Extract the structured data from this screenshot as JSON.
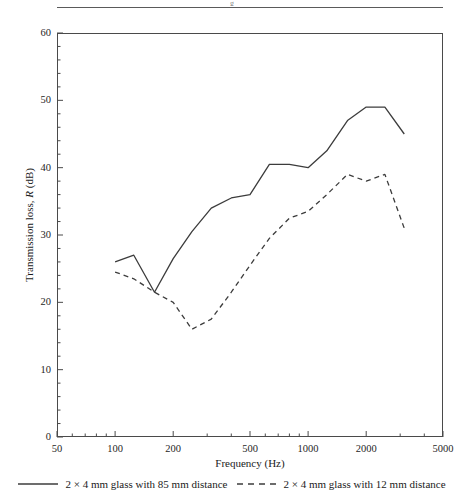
{
  "page": {
    "running_head_clipped": "g"
  },
  "chart_data": {
    "type": "line",
    "title": "",
    "xlabel": "Frequency (Hz)",
    "ylabel": "Transmission loss, R (dB)",
    "ylabel_parts": {
      "pre": "Transmission loss, ",
      "italic": "R",
      "post": " (dB)"
    },
    "xscale": "log",
    "yscale": "linear",
    "xlim": [
      50,
      5000
    ],
    "ylim": [
      0,
      60
    ],
    "grid": false,
    "legend_position": "bottom-outside",
    "xticks": [
      50,
      100,
      200,
      500,
      1000,
      2000,
      5000
    ],
    "xtick_labels": [
      "50",
      "100",
      "200",
      "500",
      "1000",
      "2000",
      "5000"
    ],
    "yticks": [
      0,
      10,
      20,
      30,
      40,
      50,
      60
    ],
    "ytick_labels": [
      "0",
      "10",
      "20",
      "30",
      "40",
      "50",
      "60"
    ],
    "y_minor_tick_step": 2,
    "series": [
      {
        "name": "2 × 4 mm glass with 85 mm distance",
        "style": "solid",
        "color": "#3c3c3c",
        "x": [
          100,
          125,
          160,
          200,
          250,
          315,
          400,
          500,
          630,
          800,
          1000,
          1250,
          1600,
          2000,
          2500,
          3150
        ],
        "y": [
          26.0,
          27.0,
          21.5,
          26.5,
          30.5,
          34.0,
          35.5,
          36.0,
          40.5,
          40.5,
          40.0,
          42.5,
          47.0,
          49.0,
          49.0,
          45.0
        ]
      },
      {
        "name": "2 × 4 mm glass with 12 mm distance",
        "style": "dashed",
        "color": "#3c3c3c",
        "x": [
          100,
          125,
          160,
          200,
          250,
          315,
          400,
          500,
          630,
          800,
          1000,
          1250,
          1600,
          2000,
          2500,
          3150
        ],
        "y": [
          24.5,
          23.5,
          21.5,
          20.0,
          16.0,
          17.5,
          21.5,
          25.5,
          29.5,
          32.5,
          33.5,
          36.0,
          39.0,
          38.0,
          39.0,
          31.0
        ]
      }
    ]
  },
  "legend": {
    "entries": [
      {
        "label": "2 × 4 mm glass with 85 mm distance",
        "style": "solid"
      },
      {
        "label": "2 × 4 mm glass with 12 mm distance",
        "style": "dashed"
      }
    ]
  }
}
